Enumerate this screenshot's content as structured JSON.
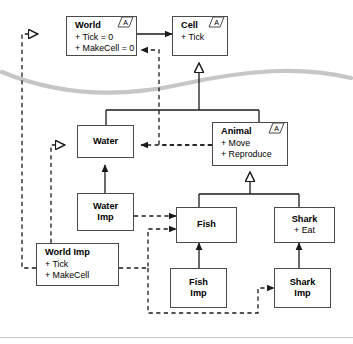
{
  "diagram": {
    "abstract_marker": "{A}",
    "colors": {
      "node_border": "#4a4a4a",
      "node_fill": "#ffffff",
      "edge_solid": "#1a1a1a",
      "edge_dashed": "#1a1a1a",
      "fold_curve": "#c6c6c6",
      "footer_rule": "#c9c9c9"
    },
    "nodes": [
      {
        "id": "world",
        "name": "World",
        "attributes": [
          "+ Tick = 0",
          "+ MakeCell = 0"
        ],
        "abstract": true
      },
      {
        "id": "cell",
        "name": "Cell",
        "attributes": [
          "+ Tick"
        ],
        "abstract": true
      },
      {
        "id": "water",
        "name": "Water",
        "attributes": [],
        "abstract": false
      },
      {
        "id": "animal",
        "name": "Animal",
        "attributes": [
          "+ Move",
          "+ Reproduce"
        ],
        "abstract": true
      },
      {
        "id": "water_imp",
        "name_line1": "Water",
        "name_line2": "Imp",
        "attributes": [],
        "abstract": false
      },
      {
        "id": "fish",
        "name": "Fish",
        "attributes": [],
        "abstract": false
      },
      {
        "id": "shark",
        "name": "Shark",
        "attributes": [
          "+ Eat"
        ],
        "abstract": false
      },
      {
        "id": "world_imp",
        "name": "World Imp",
        "attributes": [
          "+ Tick",
          "+ MakeCell"
        ],
        "abstract": false
      },
      {
        "id": "fish_imp",
        "name_line1": "Fish",
        "name_line2": "Imp",
        "attributes": [],
        "abstract": false
      },
      {
        "id": "shark_imp",
        "name_line1": "Shark",
        "name_line2": "Imp",
        "attributes": [],
        "abstract": false
      }
    ],
    "edges": [
      {
        "from": "world",
        "to": "cell",
        "kind": "association",
        "style": "solid",
        "head": "filled-arrow"
      },
      {
        "from": "water",
        "to": "cell",
        "kind": "generalization",
        "style": "solid",
        "head": "hollow-triangle"
      },
      {
        "from": "animal",
        "to": "cell",
        "kind": "generalization",
        "style": "solid",
        "head": "hollow-triangle"
      },
      {
        "from": "fish",
        "to": "animal",
        "kind": "generalization",
        "style": "solid",
        "head": "hollow-triangle"
      },
      {
        "from": "shark",
        "to": "animal",
        "kind": "generalization",
        "style": "solid",
        "head": "hollow-triangle"
      },
      {
        "from": "water_imp",
        "to": "water",
        "kind": "generalization",
        "style": "solid",
        "head": "filled-arrow"
      },
      {
        "from": "fish_imp",
        "to": "fish",
        "kind": "generalization",
        "style": "solid",
        "head": "filled-arrow"
      },
      {
        "from": "shark_imp",
        "to": "shark",
        "kind": "generalization",
        "style": "solid",
        "head": "filled-arrow"
      },
      {
        "from": "world_imp",
        "to": "world",
        "kind": "realization",
        "style": "dashed",
        "head": "hollow-triangle"
      },
      {
        "from": "world_imp",
        "to": "water",
        "kind": "realization",
        "style": "dashed",
        "head": "hollow-triangle"
      },
      {
        "from": "animal",
        "to": "world",
        "kind": "dependency",
        "style": "dashed",
        "head": "filled-arrow"
      },
      {
        "from": "animal",
        "to": "water",
        "kind": "dependency",
        "style": "dashed",
        "head": "filled-arrow"
      },
      {
        "from": "water_imp",
        "to": "fish",
        "kind": "dependency",
        "style": "dashed",
        "head": "filled-arrow"
      },
      {
        "from": "world_imp",
        "to": "fish",
        "kind": "dependency",
        "style": "dashed",
        "head": "filled-arrow"
      },
      {
        "from": "world_imp",
        "to": "shark_imp",
        "kind": "dependency",
        "style": "dashed",
        "head": "filled-arrow"
      }
    ]
  }
}
